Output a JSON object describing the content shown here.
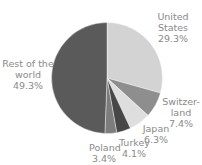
{
  "chart_data": {
    "type": "pie",
    "title": "",
    "start_angle_deg": 0,
    "direction": "clockwise",
    "slices": [
      {
        "label": "United States",
        "label_lines": [
          "United",
          "States"
        ],
        "value": 29.3,
        "value_text": "29.3%",
        "color": "#d3d3d3"
      },
      {
        "label": "Switzerland",
        "label_lines": [
          "Switzer-",
          "land"
        ],
        "value": 7.4,
        "value_text": "7.4%",
        "color": "#8e8e8e"
      },
      {
        "label": "Japan",
        "label_lines": [
          "Japan"
        ],
        "value": 6.3,
        "value_text": "6.3%",
        "color": "#dedede"
      },
      {
        "label": "Turkey",
        "label_lines": [
          "Turkey"
        ],
        "value": 4.1,
        "value_text": "4.1%",
        "color": "#474747"
      },
      {
        "label": "Poland",
        "label_lines": [
          "Poland"
        ],
        "value": 3.4,
        "value_text": "3.4%",
        "color": "#7d7d7d"
      },
      {
        "label": "Rest of the world",
        "label_lines": [
          "Rest of the",
          "world"
        ],
        "value": 49.3,
        "value_text": "49.3%",
        "color": "#5a5a5a"
      }
    ],
    "legend": "none (labels placed outside slices)"
  }
}
